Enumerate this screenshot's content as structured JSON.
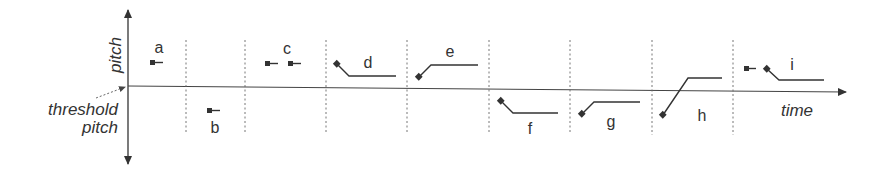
{
  "diagram": {
    "axes": {
      "y_label": "pitch",
      "x_label": "time",
      "threshold_label_line1": "threshold",
      "threshold_label_line2": "pitch"
    },
    "colors": {
      "stroke": "#333333",
      "divider": "#555555",
      "background": "#ffffff"
    },
    "panels": [
      {
        "label": "a",
        "description": "single level note above threshold"
      },
      {
        "label": "b",
        "description": "single level note below threshold"
      },
      {
        "label": "c",
        "description": "two level notes above threshold"
      },
      {
        "label": "d",
        "description": "falling glide above threshold"
      },
      {
        "label": "e",
        "description": "rising glide above threshold"
      },
      {
        "label": "f",
        "description": "falling glide below threshold"
      },
      {
        "label": "g",
        "description": "rising glide below threshold"
      },
      {
        "label": "h",
        "description": "rising glide crossing threshold"
      },
      {
        "label": "i",
        "description": "level note followed by falling glide above threshold"
      }
    ]
  }
}
